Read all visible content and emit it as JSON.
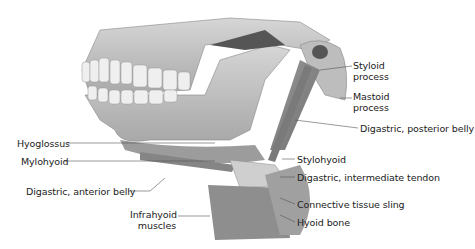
{
  "figure": {
    "labels": {
      "styloid": "Styloid\nprocess",
      "styloid_l1": "Styloid",
      "styloid_l2": "process",
      "mastoid_l1": "Mastoid",
      "mastoid_l2": "process",
      "digastric_posterior": "Digastric, posterior belly",
      "hyoglossus": "Hyoglossus",
      "mylohyoid": "Mylohyoid",
      "stylohyoid": "Stylohyoid",
      "digastric_tendon": "Digastric, intermediate tendon",
      "digastric_anterior": "Digastric, anterior belly",
      "connective_sling": "Connective tissue sling",
      "infrahyoid_l1": "Infrahyoid",
      "infrahyoid_l2": "muscles",
      "hyoid_bone": "Hyoid bone"
    }
  }
}
